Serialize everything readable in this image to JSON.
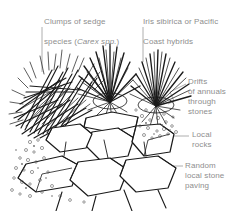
{
  "figure": {
    "ink_color": "#1a1a1a",
    "label_color": "#8e8e8e",
    "background_color": "#ffffff",
    "leader_color": "#9a9a9a"
  },
  "labels": {
    "sedge": {
      "line1": "Clumps of sedge",
      "line2_prefix": "species (",
      "line2_sci": "Carex spp.",
      "line2_suffix": ")",
      "full": "Clumps of sedge species (Carex spp.)"
    },
    "iris": {
      "line1": "Iris sibirica or Pacific",
      "line2": "Coast hybrids",
      "full": "Iris sibirica or Pacific Coast hybrids"
    },
    "drifts": {
      "text": "Drifts\nof annuals\nthrough\nstones",
      "full": "Drifts of annuals through stones"
    },
    "rocks": {
      "text": "Local\nrocks",
      "full": "Local rocks"
    },
    "paving": {
      "text": "Random\nlocal stone\npaving",
      "full": "Random local stone paving"
    }
  },
  "elements": {
    "sedge_clump_name": "sedge-clump",
    "iris_clump_left_name": "iris-clump-left",
    "iris_clump_right_name": "iris-clump-right",
    "rock_group_name": "local-rock-group",
    "paving_group_name": "stone-paving-group",
    "gravel_group_name": "gravel-drift-group"
  }
}
